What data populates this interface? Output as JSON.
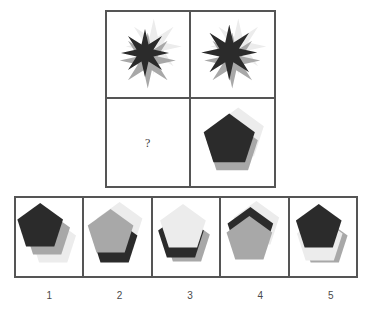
{
  "puzzle": {
    "type": "abstract-reasoning-matrix",
    "question_mark": "?",
    "colors": {
      "dark": "#2b2b2b",
      "mid": "#a8a8a8",
      "light": "#ececec",
      "border": "#555555",
      "background": "#ffffff"
    },
    "matrix": {
      "rows": 2,
      "cols": 2,
      "cells": [
        {
          "id": "cell-r1c1",
          "shape": "star8",
          "layers": [
            {
              "tone": "light",
              "dx": 6,
              "dy": -8,
              "z": 1,
              "scale": 1.0
            },
            {
              "tone": "mid",
              "dx": 0,
              "dy": 6,
              "z": 2,
              "scale": 1.0
            },
            {
              "tone": "dark",
              "dx": -3,
              "dy": -2,
              "z": 3,
              "scale": 0.86
            }
          ]
        },
        {
          "id": "cell-r1c2",
          "shape": "star8",
          "layers": [
            {
              "tone": "light",
              "dx": 6,
              "dy": -8,
              "z": 1,
              "scale": 1.0
            },
            {
              "tone": "mid",
              "dx": 0,
              "dy": 6,
              "z": 2,
              "scale": 1.0
            },
            {
              "tone": "dark",
              "dx": -3,
              "dy": -2,
              "z": 3,
              "scale": 1.0
            }
          ]
        },
        {
          "id": "cell-r1c3-missing",
          "shape": "none",
          "layers": []
        },
        {
          "id": "cell-r2c2",
          "shape": "pentagon",
          "layers": [
            {
              "tone": "light",
              "dx": 6,
              "dy": -8,
              "z": 1,
              "scale": 1.0
            },
            {
              "tone": "mid",
              "dx": 0,
              "dy": 6,
              "z": 2,
              "scale": 1.0
            },
            {
              "tone": "dark",
              "dx": -3,
              "dy": -2,
              "z": 3,
              "scale": 1.0
            }
          ]
        }
      ]
    },
    "options": [
      {
        "label": "1",
        "shape": "pentagon",
        "layers": [
          {
            "tone": "light",
            "dx": 7,
            "dy": 9,
            "z": 1,
            "scale": 1.0
          },
          {
            "tone": "mid",
            "dx": 1,
            "dy": 1,
            "z": 2,
            "scale": 1.0
          },
          {
            "tone": "dark",
            "dx": -6,
            "dy": -7,
            "z": 3,
            "scale": 1.0
          }
        ]
      },
      {
        "label": "2",
        "shape": "pentagon",
        "layers": [
          {
            "tone": "light",
            "dx": 5,
            "dy": -8,
            "z": 1,
            "scale": 1.0
          },
          {
            "tone": "dark",
            "dx": 0,
            "dy": 9,
            "z": 2,
            "scale": 1.0
          },
          {
            "tone": "mid",
            "dx": -4,
            "dy": -1,
            "z": 3,
            "scale": 1.0
          }
        ]
      },
      {
        "label": "3",
        "shape": "pentagon",
        "layers": [
          {
            "tone": "mid",
            "dx": 4,
            "dy": 8,
            "z": 1,
            "scale": 1.0
          },
          {
            "tone": "dark",
            "dx": -2,
            "dy": 4,
            "z": 2,
            "scale": 1.0
          },
          {
            "tone": "light",
            "dx": 0,
            "dy": -6,
            "z": 3,
            "scale": 1.0
          }
        ]
      },
      {
        "label": "4",
        "shape": "pentagon",
        "layers": [
          {
            "tone": "light",
            "dx": 5,
            "dy": -9,
            "z": 1,
            "scale": 1.0
          },
          {
            "tone": "dark",
            "dx": -1,
            "dy": -3,
            "z": 2,
            "scale": 1.0
          },
          {
            "tone": "mid",
            "dx": -2,
            "dy": 6,
            "z": 3,
            "scale": 1.0
          }
        ]
      },
      {
        "label": "5",
        "shape": "pentagon",
        "layers": [
          {
            "tone": "mid",
            "dx": 5,
            "dy": 9,
            "z": 1,
            "scale": 1.0
          },
          {
            "tone": "light",
            "dx": 0,
            "dy": 7,
            "z": 2,
            "scale": 1.0
          },
          {
            "tone": "dark",
            "dx": -1,
            "dy": -6,
            "z": 3,
            "scale": 1.0
          }
        ]
      }
    ]
  }
}
